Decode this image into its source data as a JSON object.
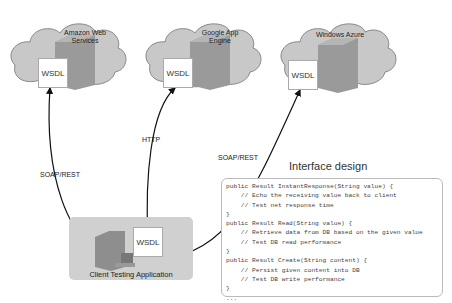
{
  "clouds": [
    {
      "name": "Amazon Web Services",
      "line1": "Amazon Web",
      "line2": "Services",
      "wsdl": "WSDL"
    },
    {
      "name": "Google App Engine",
      "line1": "Google App",
      "line2": "Engine",
      "wsdl": "WSDL"
    },
    {
      "name": "Windows Azure",
      "line1": "Windows Azure",
      "line2": "",
      "wsdl": "WSDL"
    }
  ],
  "connections": [
    {
      "label": "SOAP/REST",
      "target": "Amazon Web Services"
    },
    {
      "label": "HTTP",
      "target": "Google App Engine"
    },
    {
      "label": "SOAP/REST",
      "target": "Windows Azure"
    }
  ],
  "client": {
    "label": "Client Testing Application",
    "wsdl": "WSDL"
  },
  "interface": {
    "title": "Interface design",
    "code_lines": [
      "public Result InstantResponse(String value) {",
      "    // Echo the receiving value back to client",
      "    // Test net response time",
      "}",
      "public Result Read(String value) {",
      "    // Retrieve data from DB based on the given value",
      "    // Test DB read performance",
      "}",
      "public Result Create(String content) {",
      "    // Persist given content into DB",
      "    // Test DB write performance",
      "}",
      "..."
    ]
  }
}
